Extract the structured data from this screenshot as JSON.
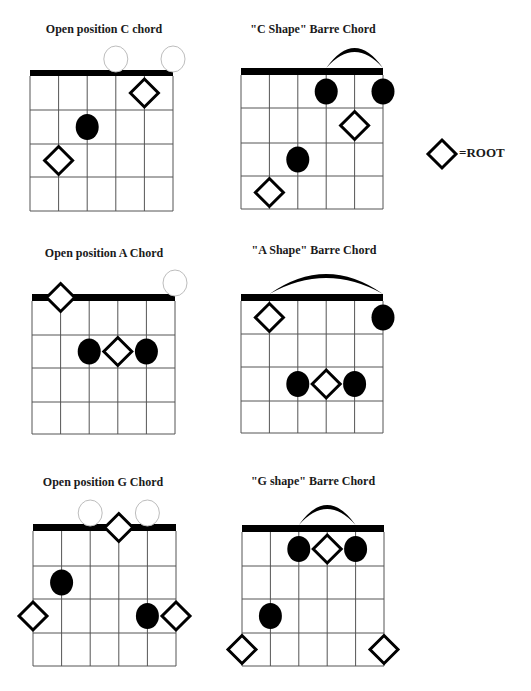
{
  "legend": {
    "symbol": "diamond",
    "label": "=ROOT",
    "cx": 442,
    "cy": 154,
    "r": 14
  },
  "chords": [
    {
      "id": "open-c",
      "title": "Open position C chord",
      "title_x": 104,
      "title_y": 22,
      "grid": {
        "left": 30,
        "right": 173,
        "nut_top": 70,
        "nut_bottom": 76,
        "frets": [
          110,
          144,
          177,
          211
        ]
      },
      "open_strings": [
        4,
        6
      ],
      "barre_arc": null,
      "dots": [
        {
          "string": 3,
          "fret": 2
        }
      ],
      "roots": [
        {
          "string": 5,
          "fret": 1
        },
        {
          "string": 2,
          "fret": 3
        }
      ]
    },
    {
      "id": "c-shape-barre",
      "title": "\"C Shape\" Barre Chord",
      "title_x": 313,
      "title_y": 22,
      "grid": {
        "left": 241,
        "right": 383,
        "nut_top": 68,
        "nut_bottom": 75,
        "frets": [
          108,
          143,
          176,
          209
        ]
      },
      "open_strings": [],
      "barre_arc": {
        "from": 4,
        "to": 6,
        "height": 20
      },
      "dots": [
        {
          "string": 4,
          "fret": 1
        },
        {
          "string": 6,
          "fret": 1
        },
        {
          "string": 3,
          "fret": 3
        }
      ],
      "roots": [
        {
          "string": 5,
          "fret": 2
        },
        {
          "string": 2,
          "fret": 4
        }
      ]
    },
    {
      "id": "open-a",
      "title": "Open position A Chord",
      "title_x": 104,
      "title_y": 246,
      "grid": {
        "left": 32,
        "right": 175,
        "nut_top": 294,
        "nut_bottom": 301,
        "frets": [
          335,
          368,
          402,
          434
        ]
      },
      "open_strings": [
        6
      ],
      "barre_arc": null,
      "dots": [
        {
          "string": 3,
          "fret": 2
        },
        {
          "string": 5,
          "fret": 2
        }
      ],
      "roots": [
        {
          "string": 2,
          "fret": 0
        },
        {
          "string": 4,
          "fret": 2
        }
      ]
    },
    {
      "id": "a-shape-barre",
      "title": "\"A Shape\" Barre Chord",
      "title_x": 314,
      "title_y": 243,
      "grid": {
        "left": 241,
        "right": 383,
        "nut_top": 294,
        "nut_bottom": 301,
        "frets": [
          334,
          367,
          401,
          433
        ]
      },
      "open_strings": [],
      "barre_arc": {
        "from": 2,
        "to": 6,
        "height": 20
      },
      "dots": [
        {
          "string": 6,
          "fret": 1
        },
        {
          "string": 3,
          "fret": 3
        },
        {
          "string": 5,
          "fret": 3
        }
      ],
      "roots": [
        {
          "string": 2,
          "fret": 1
        },
        {
          "string": 4,
          "fret": 3
        }
      ]
    },
    {
      "id": "open-g",
      "title": "Open position G Chord",
      "title_x": 103,
      "title_y": 475,
      "grid": {
        "left": 33,
        "right": 176,
        "nut_top": 524,
        "nut_bottom": 531,
        "frets": [
          566,
          599,
          633,
          666
        ]
      },
      "open_strings": [
        3,
        5
      ],
      "barre_arc": null,
      "dots": [
        {
          "string": 2,
          "fret": 2
        },
        {
          "string": 5,
          "fret": 3
        }
      ],
      "roots": [
        {
          "string": 4,
          "fret": 0
        },
        {
          "string": 1,
          "fret": 3
        },
        {
          "string": 6,
          "fret": 3
        }
      ]
    },
    {
      "id": "g-shape-barre",
      "title": "\"G shape\" Barre Chord",
      "title_x": 313,
      "title_y": 474,
      "grid": {
        "left": 242,
        "right": 384,
        "nut_top": 525,
        "nut_bottom": 532,
        "frets": [
          566,
          599,
          633,
          666
        ]
      },
      "open_strings": [],
      "barre_arc": {
        "from": 3,
        "to": 5,
        "height": 20
      },
      "dots": [
        {
          "string": 3,
          "fret": 1
        },
        {
          "string": 5,
          "fret": 1
        },
        {
          "string": 2,
          "fret": 3
        }
      ],
      "roots": [
        {
          "string": 4,
          "fret": 1
        },
        {
          "string": 1,
          "fret": 4
        },
        {
          "string": 6,
          "fret": 4
        }
      ]
    }
  ],
  "colors": {
    "ink": "#000000",
    "grid": "#555555",
    "open_circle": "#bdbdbd",
    "background": "#ffffff"
  }
}
